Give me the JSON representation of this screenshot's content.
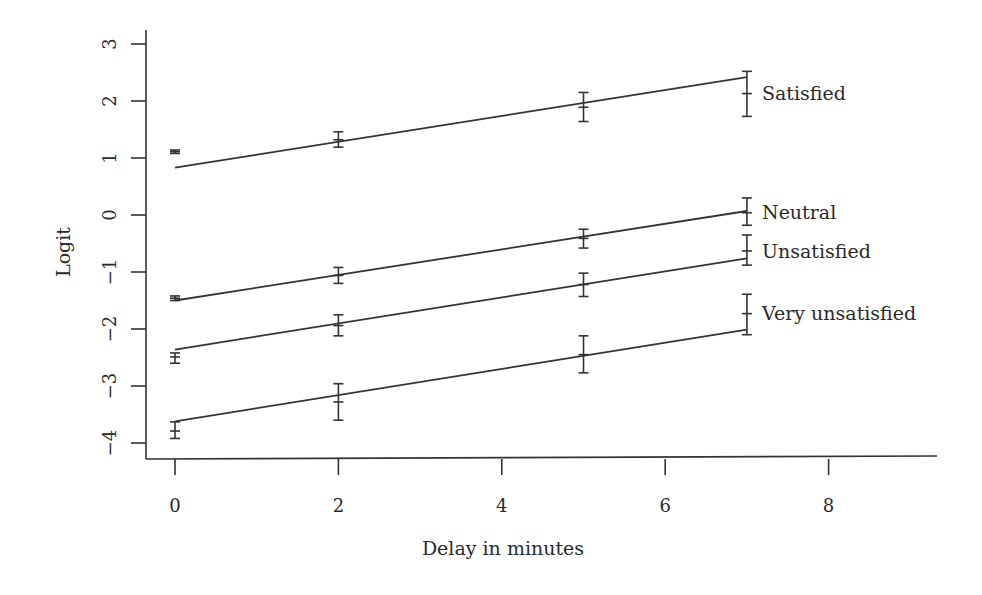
{
  "chart_data": {
    "type": "line",
    "title": "",
    "xlabel": "Delay in minutes",
    "ylabel": "Logit",
    "xlim": [
      -0.4,
      9.4
    ],
    "ylim": [
      -4.3,
      3.3
    ],
    "xticks": [
      0,
      2,
      4,
      6,
      8
    ],
    "yticks": [
      -4,
      -3,
      -2,
      -1,
      0,
      1,
      2,
      3
    ],
    "xtick_labels": [
      "0",
      "2",
      "4",
      "6",
      "8"
    ],
    "ytick_labels": [
      "−4",
      "−3",
      "−2",
      "−1",
      "0",
      "1",
      "2",
      "3"
    ],
    "grid": false,
    "legend_position": "inline labels at right end of each line",
    "x": [
      0,
      2,
      5,
      7
    ],
    "series": [
      {
        "name": "Satisfied",
        "values": [
          1.11,
          1.32,
          1.89,
          2.13
        ],
        "error_low": [
          1.08,
          1.19,
          1.64,
          1.73
        ],
        "error_high": [
          1.14,
          1.46,
          2.15,
          2.52
        ],
        "fit_line": {
          "x": [
            0,
            7
          ],
          "y": [
            0.83,
            2.42
          ]
        }
      },
      {
        "name": "Neutral",
        "values": [
          -1.46,
          -1.06,
          -0.41,
          0.04
        ],
        "error_low": [
          -1.5,
          -1.2,
          -0.58,
          -0.18
        ],
        "error_high": [
          -1.42,
          -0.92,
          -0.25,
          0.3
        ],
        "fit_line": {
          "x": [
            0,
            7
          ],
          "y": [
            -1.5,
            0.07
          ]
        }
      },
      {
        "name": "Unsatisfied",
        "values": [
          -2.49,
          -1.94,
          -1.22,
          -0.63
        ],
        "error_low": [
          -2.6,
          -2.12,
          -1.43,
          -0.88
        ],
        "error_high": [
          -2.42,
          -1.75,
          -1.02,
          -0.35
        ],
        "fit_line": {
          "x": [
            0,
            7
          ],
          "y": [
            -2.36,
            -0.76
          ]
        }
      },
      {
        "name": "Very unsatisfied",
        "values": [
          -3.79,
          -3.28,
          -2.45,
          -1.73
        ],
        "error_low": [
          -3.92,
          -3.6,
          -2.77,
          -2.1
        ],
        "error_high": [
          -3.63,
          -2.96,
          -2.12,
          -1.39
        ],
        "fit_line": {
          "x": [
            0,
            7
          ],
          "y": [
            -3.62,
            -2.01
          ]
        }
      }
    ]
  }
}
